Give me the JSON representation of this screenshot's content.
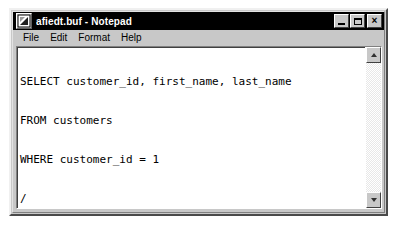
{
  "window": {
    "title": "afiedt.buf - Notepad",
    "icon": "notepad-document-icon",
    "titlebar_color": "#000000",
    "titlebar_text_color": "#ffffff",
    "chrome_color": "#c8c8c8"
  },
  "window_buttons": {
    "minimize_label": "_",
    "maximize_label": "□",
    "close_label": "×"
  },
  "menu": {
    "items": [
      {
        "label": "File"
      },
      {
        "label": "Edit"
      },
      {
        "label": "Format"
      },
      {
        "label": "Help"
      }
    ]
  },
  "editor": {
    "background_color": "#ffffff",
    "text_color": "#000000",
    "lines": [
      "SELECT customer_id, first_name, last_name",
      "FROM customers",
      "WHERE customer_id = 1",
      "/"
    ]
  },
  "scrollbar": {
    "up_arrow": "scroll-up-arrow-icon",
    "down_arrow": "scroll-down-arrow-icon",
    "orientation": "vertical"
  }
}
